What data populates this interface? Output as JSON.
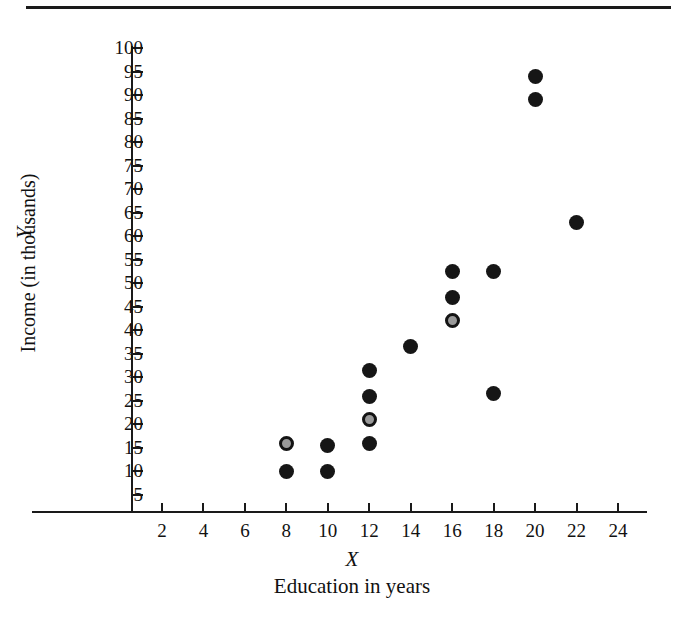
{
  "chart_data": {
    "type": "scatter",
    "title": "",
    "xlabel": "X",
    "xlabel_sub": "Education in years",
    "ylabel": "Y",
    "ylabel_sub": "Income (in thousands)",
    "xlim": [
      0,
      25
    ],
    "ylim": [
      0,
      102.5
    ],
    "grid": false,
    "legend": "none",
    "xticks": [
      2,
      4,
      6,
      8,
      10,
      12,
      14,
      16,
      18,
      20,
      22,
      24
    ],
    "yticks": [
      5,
      10,
      15,
      20,
      25,
      30,
      35,
      40,
      45,
      50,
      55,
      60,
      65,
      70,
      75,
      80,
      85,
      90,
      95,
      100
    ],
    "xtick_labels": [
      "2",
      "4",
      "6",
      "8",
      "10",
      "12",
      "14",
      "16",
      "18",
      "20",
      "22",
      "24"
    ],
    "ytick_labels": [
      "5",
      "10",
      "15",
      "20",
      "25",
      "30",
      "35",
      "40",
      "45",
      "50",
      "55",
      "60",
      "65",
      "70",
      "75",
      "80",
      "85",
      "90",
      "95",
      "100"
    ],
    "marker_styles": {
      "solid": "filled black circle",
      "highlight": "gray filled circle with black ring"
    },
    "points": [
      {
        "x": 8,
        "y": 16,
        "style": "highlight"
      },
      {
        "x": 8,
        "y": 10,
        "style": "solid"
      },
      {
        "x": 10,
        "y": 15.5,
        "style": "solid"
      },
      {
        "x": 10,
        "y": 10,
        "style": "solid"
      },
      {
        "x": 12,
        "y": 31.5,
        "style": "solid"
      },
      {
        "x": 12,
        "y": 26,
        "style": "solid"
      },
      {
        "x": 12,
        "y": 21,
        "style": "highlight"
      },
      {
        "x": 12,
        "y": 16,
        "style": "solid"
      },
      {
        "x": 14,
        "y": 36.5,
        "style": "solid"
      },
      {
        "x": 16,
        "y": 52.5,
        "style": "solid"
      },
      {
        "x": 16,
        "y": 47,
        "style": "solid"
      },
      {
        "x": 16,
        "y": 42,
        "style": "highlight"
      },
      {
        "x": 18,
        "y": 52.5,
        "style": "solid"
      },
      {
        "x": 18,
        "y": 26.5,
        "style": "solid"
      },
      {
        "x": 20,
        "y": 94,
        "style": "solid"
      },
      {
        "x": 20,
        "y": 89,
        "style": "solid"
      },
      {
        "x": 22,
        "y": 63,
        "style": "solid"
      }
    ]
  },
  "colors": {
    "marker_solid": "#161616",
    "marker_highlight_fill": "#9a9a9a",
    "marker_highlight_ring": "#141414",
    "axis": "#1a1a1a",
    "background": "#ffffff"
  }
}
